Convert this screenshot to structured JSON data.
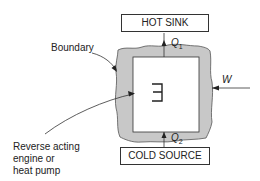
{
  "diagram": {
    "hot_sink": {
      "label": "HOT SINK"
    },
    "cold_source": {
      "label": "COLD SOURCE"
    },
    "q1": {
      "symbol": "Q",
      "subscript": "1"
    },
    "q2": {
      "symbol": "Q",
      "subscript": "2"
    },
    "work": {
      "symbol": "W"
    },
    "boundary": {
      "label": "Boundary"
    },
    "device": {
      "symbol": "Ǝ",
      "label_lines": [
        "Reverse acting",
        "engine or",
        "heat pump"
      ]
    },
    "colors": {
      "boundary_fill": "#c8c8c8",
      "line": "#333333"
    }
  }
}
